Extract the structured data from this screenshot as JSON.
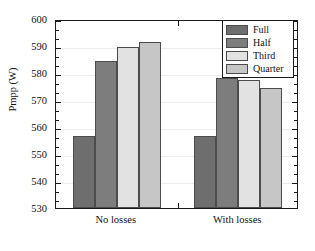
{
  "chart_data": {
    "type": "bar",
    "title": "",
    "xlabel": "",
    "ylabel": "Pmpp (W)",
    "categories": [
      "No losses",
      "With losses"
    ],
    "series": [
      {
        "name": "Full",
        "color": "#6e6e6e",
        "values": [
          556.5,
          556.5
        ]
      },
      {
        "name": "Half",
        "color": "#7d7d7d",
        "values": [
          584.5,
          578.0
        ]
      },
      {
        "name": "Third",
        "color": "#e2e2e2",
        "values": [
          589.5,
          577.5
        ]
      },
      {
        "name": "Quarter",
        "color": "#c6c6c6",
        "values": [
          591.5,
          574.3
        ]
      }
    ],
    "ylim": [
      530,
      600
    ],
    "ytick_step": 10,
    "yticks": [
      530,
      540,
      550,
      560,
      570,
      580,
      590,
      600
    ],
    "ytick_labels": [
      "530",
      "540",
      "550",
      "560",
      "570",
      "580",
      "590",
      "600"
    ],
    "minor_ticks_per_interval": 2,
    "grid": true,
    "legend_position": "top-right",
    "axis_color": "#1a1a1a",
    "grid_color": "#ececec",
    "bar_edge_color": "#4c4c4c",
    "background": "#ffffff"
  }
}
